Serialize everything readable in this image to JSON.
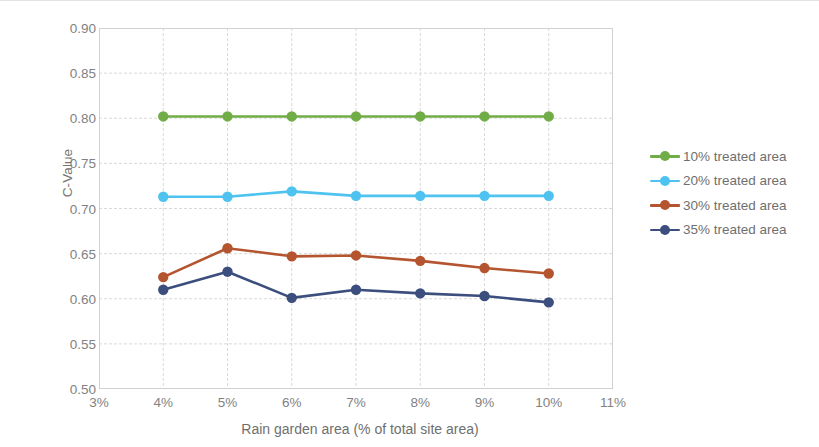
{
  "chart_data": {
    "type": "line",
    "title": "",
    "xlabel": "Rain garden area (% of total site area)",
    "ylabel": "C-Value",
    "x": [
      4,
      5,
      6,
      7,
      8,
      9,
      10
    ],
    "xtick_labels": [
      "3%",
      "4%",
      "5%",
      "6%",
      "7%",
      "8%",
      "9%",
      "10%",
      "11%"
    ],
    "xtick_values": [
      3,
      4,
      5,
      6,
      7,
      8,
      9,
      10,
      11
    ],
    "ytick_labels": [
      "0.50",
      "0.55",
      "0.60",
      "0.65",
      "0.70",
      "0.75",
      "0.80",
      "0.85",
      "0.90"
    ],
    "ytick_values": [
      0.5,
      0.55,
      0.6,
      0.65,
      0.7,
      0.75,
      0.8,
      0.85,
      0.9
    ],
    "xlim": [
      3,
      11
    ],
    "ylim": [
      0.5,
      0.9
    ],
    "grid": true,
    "legend_position": "right",
    "series": [
      {
        "name": "10% treated area",
        "color": "#70AD47",
        "values": [
          0.802,
          0.802,
          0.802,
          0.802,
          0.802,
          0.802,
          0.802
        ]
      },
      {
        "name": "20% treated area",
        "color": "#4FC3F0",
        "values": [
          0.713,
          0.713,
          0.719,
          0.714,
          0.714,
          0.714,
          0.714
        ]
      },
      {
        "name": "30% treated area",
        "color": "#B5552F",
        "values": [
          0.624,
          0.656,
          0.647,
          0.648,
          0.642,
          0.634,
          0.628
        ]
      },
      {
        "name": "35% treated area",
        "color": "#3B4E7E",
        "values": [
          0.61,
          0.63,
          0.601,
          0.61,
          0.606,
          0.603,
          0.596
        ]
      }
    ]
  },
  "legend": {
    "items": [
      {
        "label": "10% treated area"
      },
      {
        "label": "20% treated area"
      },
      {
        "label": "30% treated area"
      },
      {
        "label": "35% treated area"
      }
    ]
  }
}
